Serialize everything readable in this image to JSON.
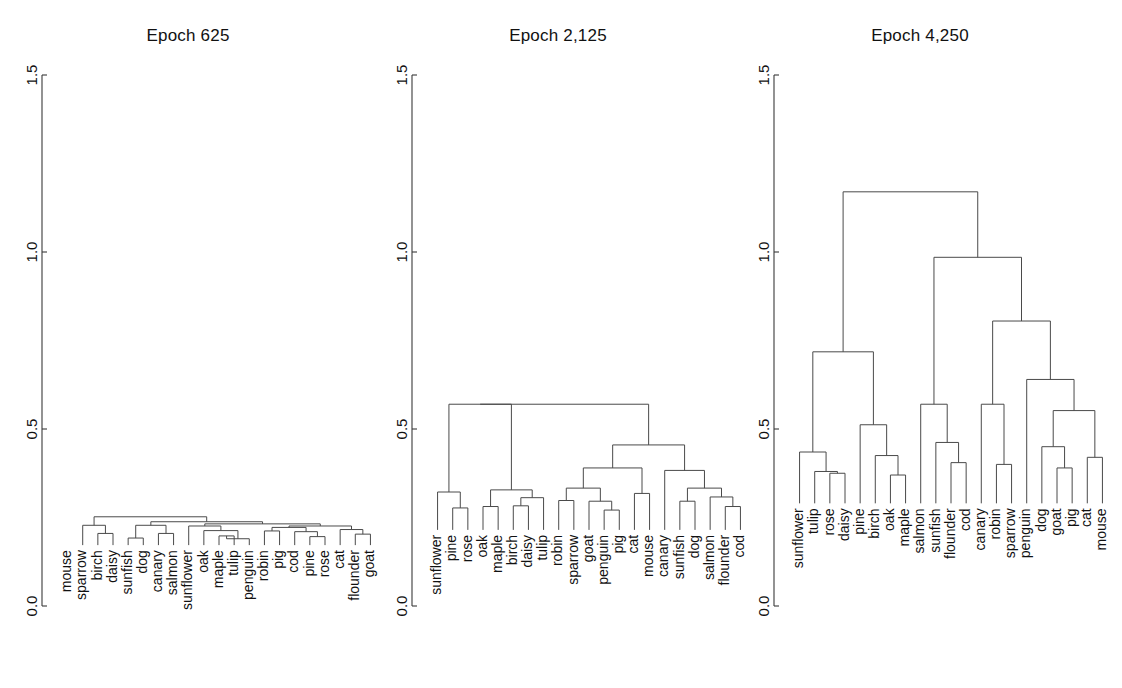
{
  "figure": {
    "width": 1122,
    "height": 688,
    "background": "#ffffff",
    "line_color": "#4a4a4a",
    "axis_color": "#3a3a3a",
    "text_color": "#111111"
  },
  "axis": {
    "ticks": [
      "0.0",
      "0.5",
      "1.0",
      "1.5"
    ],
    "tick_values": [
      0.0,
      0.5,
      1.0,
      1.5
    ],
    "ylim": [
      0.0,
      1.5
    ],
    "y_pixel_top": 75,
    "y_pixel_bottom": 606
  },
  "chart_data": {
    "type": "dendrogram",
    "title": "",
    "xlabel": "",
    "ylabel": "",
    "ylim": [
      0.0,
      1.5
    ],
    "yticks": [
      0.0,
      0.5,
      1.0,
      1.5
    ],
    "grid": false,
    "legend": "none",
    "panels": [
      {
        "title": "Epoch 625",
        "plot_left": 60,
        "plot_right": 378,
        "leaves": [
          "mouse",
          "sparrow",
          "birch",
          "daisy",
          "sunfish",
          "dog",
          "canary",
          "salmon",
          "sunflower",
          "oak",
          "maple",
          "tulip",
          "penguin",
          "robin",
          "pig",
          "cod",
          "pine",
          "rose",
          "cat",
          "flounder",
          "goat"
        ],
        "leaf_base": 0.172,
        "merges": [
          {
            "a": {
              "leaf": 2
            },
            "b": {
              "leaf": 3
            },
            "h": 0.205
          },
          {
            "a": {
              "leaf": 1
            },
            "b": {
              "node": 0
            },
            "h": 0.228
          },
          {
            "a": {
              "leaf": 4
            },
            "b": {
              "leaf": 5
            },
            "h": 0.192
          },
          {
            "a": {
              "leaf": 6
            },
            "b": {
              "leaf": 7
            },
            "h": 0.205
          },
          {
            "a": {
              "node": 2
            },
            "b": {
              "node": 3
            },
            "h": 0.228
          },
          {
            "a": {
              "leaf": 10
            },
            "b": {
              "leaf": 11
            },
            "h": 0.198
          },
          {
            "a": {
              "node": 5
            },
            "b": {
              "leaf": 12
            },
            "h": 0.19
          },
          {
            "a": {
              "leaf": 9
            },
            "b": {
              "node": 6
            },
            "h": 0.213
          },
          {
            "a": {
              "leaf": 8
            },
            "b": {
              "node": 7
            },
            "h": 0.226
          },
          {
            "a": {
              "leaf": 13
            },
            "b": {
              "leaf": 14
            },
            "h": 0.212
          },
          {
            "a": {
              "leaf": 16
            },
            "b": {
              "leaf": 17
            },
            "h": 0.196
          },
          {
            "a": {
              "leaf": 15
            },
            "b": {
              "node": 10
            },
            "h": 0.21
          },
          {
            "a": {
              "node": 9
            },
            "b": {
              "node": 11
            },
            "h": 0.222
          },
          {
            "a": {
              "leaf": 19
            },
            "b": {
              "leaf": 20
            },
            "h": 0.203
          },
          {
            "a": {
              "leaf": 18
            },
            "b": {
              "node": 13
            },
            "h": 0.216
          },
          {
            "a": {
              "node": 12
            },
            "b": {
              "node": 14
            },
            "h": 0.226
          },
          {
            "a": {
              "node": 8
            },
            "b": {
              "node": 15
            },
            "h": 0.232
          },
          {
            "a": {
              "node": 4
            },
            "b": {
              "node": 16
            },
            "h": 0.238
          },
          {
            "a": {
              "node": 1
            },
            "b": {
              "node": 17
            },
            "h": 0.252
          }
        ]
      },
      {
        "title": "Epoch 2,125",
        "plot_left": 430,
        "plot_right": 748,
        "leaves": [
          "sunflower",
          "pine",
          "rose",
          "oak",
          "maple",
          "birch",
          "daisy",
          "tulip",
          "robin",
          "sparrow",
          "goat",
          "penguin",
          "pig",
          "cat",
          "mouse",
          "canary",
          "sunfish",
          "dog",
          "salmon",
          "flounder",
          "cod"
        ],
        "leaf_base": 0.215,
        "merges": [
          {
            "a": {
              "leaf": 1
            },
            "b": {
              "leaf": 2
            },
            "h": 0.277
          },
          {
            "a": {
              "leaf": 0
            },
            "b": {
              "node": 0
            },
            "h": 0.322
          },
          {
            "a": {
              "leaf": 5
            },
            "b": {
              "leaf": 6
            },
            "h": 0.283
          },
          {
            "a": {
              "node": 2
            },
            "b": {
              "leaf": 7
            },
            "h": 0.306
          },
          {
            "a": {
              "leaf": 3
            },
            "b": {
              "leaf": 4
            },
            "h": 0.281
          },
          {
            "a": {
              "node": 4
            },
            "b": {
              "node": 3
            },
            "h": 0.328
          },
          {
            "a": {
              "node": 1
            },
            "b": {
              "node": 5
            },
            "h": 0.57
          },
          {
            "a": {
              "leaf": 8
            },
            "b": {
              "leaf": 9
            },
            "h": 0.298
          },
          {
            "a": {
              "leaf": 11
            },
            "b": {
              "leaf": 12
            },
            "h": 0.271
          },
          {
            "a": {
              "leaf": 10
            },
            "b": {
              "node": 8
            },
            "h": 0.296
          },
          {
            "a": {
              "node": 7
            },
            "b": {
              "node": 9
            },
            "h": 0.333
          },
          {
            "a": {
              "leaf": 13
            },
            "b": {
              "leaf": 14
            },
            "h": 0.318
          },
          {
            "a": {
              "node": 10
            },
            "b": {
              "node": 11
            },
            "h": 0.39
          },
          {
            "a": {
              "leaf": 16
            },
            "b": {
              "leaf": 17
            },
            "h": 0.296
          },
          {
            "a": {
              "leaf": 19
            },
            "b": {
              "leaf": 20
            },
            "h": 0.281
          },
          {
            "a": {
              "leaf": 18
            },
            "b": {
              "node": 14
            },
            "h": 0.308
          },
          {
            "a": {
              "node": 13
            },
            "b": {
              "node": 15
            },
            "h": 0.333
          },
          {
            "a": {
              "leaf": 15
            },
            "b": {
              "node": 16
            },
            "h": 0.383
          },
          {
            "a": {
              "node": 12
            },
            "b": {
              "node": 17
            },
            "h": 0.455
          },
          {
            "a": {
              "node": 6
            },
            "b": {
              "node": 18
            },
            "h": 0.57
          }
        ]
      },
      {
        "title": "Epoch 4,250",
        "plot_left": 792,
        "plot_right": 1110,
        "leaves": [
          "sunflower",
          "tulip",
          "rose",
          "daisy",
          "pine",
          "birch",
          "oak",
          "maple",
          "salmon",
          "sunfish",
          "flounder",
          "cod",
          "canary",
          "robin",
          "sparrow",
          "penguin",
          "dog",
          "goat",
          "pig",
          "cat",
          "mouse"
        ],
        "leaf_base": 0.29,
        "merges": [
          {
            "a": {
              "leaf": 2
            },
            "b": {
              "leaf": 3
            },
            "h": 0.375
          },
          {
            "a": {
              "leaf": 1
            },
            "b": {
              "node": 0
            },
            "h": 0.38
          },
          {
            "a": {
              "leaf": 0
            },
            "b": {
              "node": 1
            },
            "h": 0.435
          },
          {
            "a": {
              "leaf": 6
            },
            "b": {
              "leaf": 7
            },
            "h": 0.37
          },
          {
            "a": {
              "leaf": 5
            },
            "b": {
              "node": 3
            },
            "h": 0.425
          },
          {
            "a": {
              "leaf": 4
            },
            "b": {
              "node": 4
            },
            "h": 0.512
          },
          {
            "a": {
              "node": 2
            },
            "b": {
              "node": 5
            },
            "h": 0.718
          },
          {
            "a": {
              "leaf": 10
            },
            "b": {
              "leaf": 11
            },
            "h": 0.405
          },
          {
            "a": {
              "leaf": 9
            },
            "b": {
              "node": 7
            },
            "h": 0.462
          },
          {
            "a": {
              "leaf": 8
            },
            "b": {
              "node": 8
            },
            "h": 0.57
          },
          {
            "a": {
              "leaf": 13
            },
            "b": {
              "leaf": 14
            },
            "h": 0.4
          },
          {
            "a": {
              "leaf": 12
            },
            "b": {
              "node": 10
            },
            "h": 0.57
          },
          {
            "a": {
              "leaf": 17
            },
            "b": {
              "leaf": 18
            },
            "h": 0.39
          },
          {
            "a": {
              "leaf": 16
            },
            "b": {
              "node": 12
            },
            "h": 0.45
          },
          {
            "a": {
              "leaf": 19
            },
            "b": {
              "leaf": 20
            },
            "h": 0.42
          },
          {
            "a": {
              "node": 13
            },
            "b": {
              "node": 14
            },
            "h": 0.552
          },
          {
            "a": {
              "leaf": 15
            },
            "b": {
              "node": 15
            },
            "h": 0.64
          },
          {
            "a": {
              "node": 11
            },
            "b": {
              "node": 16
            },
            "h": 0.805
          },
          {
            "a": {
              "node": 9
            },
            "b": {
              "node": 17
            },
            "h": 0.985
          },
          {
            "a": {
              "node": 6
            },
            "b": {
              "node": 18
            },
            "h": 1.17
          }
        ]
      }
    ]
  }
}
